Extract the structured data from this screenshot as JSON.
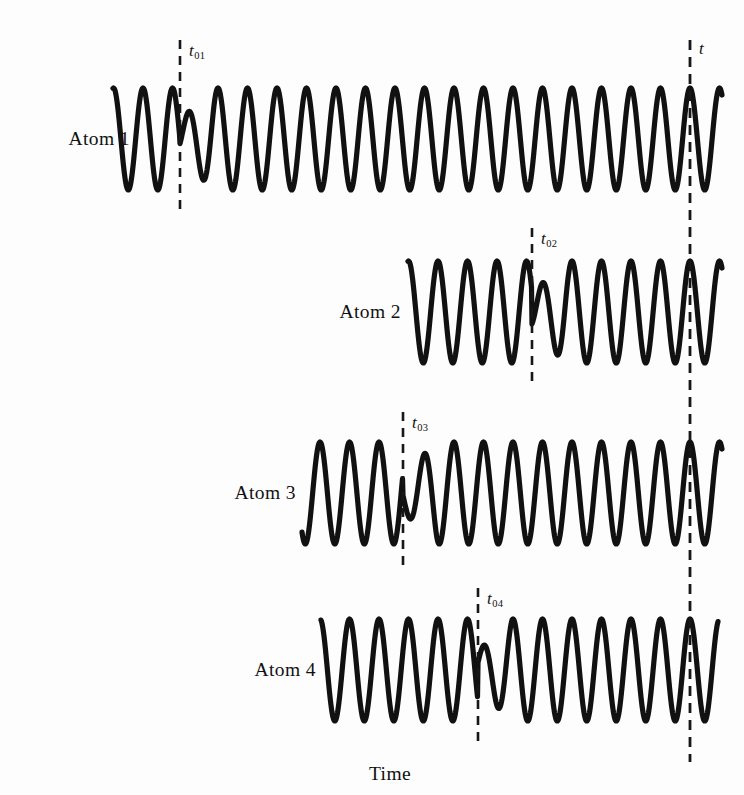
{
  "figure": {
    "axis_label": "Time",
    "axis_label_x": 390,
    "axis_label_y": 763,
    "background_color": "#fdfdfd",
    "stroke_color": "#111111",
    "width": 744,
    "height": 795
  },
  "global_marker": {
    "label": "t",
    "subscript": "",
    "x": 690,
    "y_top": 40,
    "y_bottom": 762,
    "label_x": 699,
    "label_y": 40
  },
  "wave": {
    "period": 29.5,
    "amplitude": 51,
    "jump_amplitude_ratio": 0.38,
    "phase_shift": 3.4
  },
  "rows": [
    {
      "label": "Atom 1",
      "label_x": 130,
      "label_y": 139,
      "center_y": 139,
      "x_start": 113,
      "x_end": 722,
      "marker": {
        "label": "t",
        "subscript": "01",
        "x": 180,
        "y_top": 40,
        "y_bottom": 212,
        "label_x": 189,
        "label_y": 42
      }
    },
    {
      "label": "Atom 2",
      "label_x": 401,
      "label_y": 312,
      "center_y": 312,
      "x_start": 408,
      "x_end": 722,
      "marker": {
        "label": "t",
        "subscript": "02",
        "x": 532,
        "y_top": 228,
        "y_bottom": 388,
        "label_x": 541,
        "label_y": 230
      }
    },
    {
      "label": "Atom 3",
      "label_x": 296,
      "label_y": 493,
      "center_y": 493,
      "x_start": 302,
      "x_end": 722,
      "marker": {
        "label": "t",
        "subscript": "03",
        "x": 403,
        "y_top": 412,
        "y_bottom": 570,
        "label_x": 412,
        "label_y": 414
      }
    },
    {
      "label": "Atom 4",
      "label_x": 316,
      "label_y": 670,
      "center_y": 670,
      "x_start": 321,
      "x_end": 718,
      "marker": {
        "label": "t",
        "subscript": "04",
        "x": 478,
        "y_top": 588,
        "y_bottom": 748,
        "label_x": 487,
        "label_y": 590
      }
    }
  ]
}
